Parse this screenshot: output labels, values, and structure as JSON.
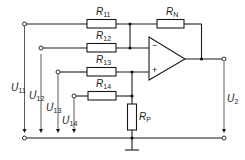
{
  "diagram": {
    "type": "circuit-schematic",
    "resistors": {
      "r11": {
        "sym": "R",
        "sub": "11"
      },
      "r12": {
        "sym": "R",
        "sub": "12"
      },
      "r13": {
        "sym": "R",
        "sub": "13"
      },
      "r14": {
        "sym": "R",
        "sub": "14"
      },
      "rn": {
        "sym": "R",
        "sub": "N"
      },
      "rp": {
        "sym": "R",
        "sub": "P"
      }
    },
    "voltages": {
      "u11": {
        "sym": "U",
        "prime": "'",
        "sub": "11"
      },
      "u12": {
        "sym": "U",
        "prime": "'",
        "sub": "12"
      },
      "u13": {
        "sym": "U",
        "prime": "'",
        "sub": "13"
      },
      "u14": {
        "sym": "U",
        "prime": "'",
        "sub": "14"
      },
      "u2": {
        "sym": "U",
        "prime": "'",
        "sub": "2"
      }
    },
    "opamp": {
      "minus": "−",
      "plus": "+"
    }
  }
}
